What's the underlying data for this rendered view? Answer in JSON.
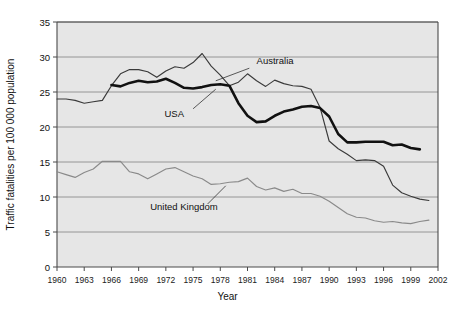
{
  "chart_data": {
    "type": "line",
    "title": "",
    "xlabel": "Year",
    "ylabel": "Traffic fatalities per 100 000 population",
    "xlim": [
      1960,
      2002
    ],
    "ylim": [
      0,
      35
    ],
    "yticks": [
      0,
      5,
      10,
      15,
      20,
      25,
      30,
      35
    ],
    "xticks": [
      1960,
      1963,
      1966,
      1969,
      1972,
      1975,
      1978,
      1981,
      1984,
      1987,
      1990,
      1993,
      1996,
      1999,
      2002
    ],
    "grid": true,
    "legend_position": "inline-annotations",
    "series": [
      {
        "name": "Australia",
        "color": "#3a3a3a",
        "x": [
          1960,
          1961,
          1962,
          1963,
          1964,
          1965,
          1966,
          1967,
          1968,
          1969,
          1970,
          1971,
          1972,
          1973,
          1974,
          1975,
          1976,
          1977,
          1978,
          1979,
          1980,
          1981,
          1982,
          1983,
          1984,
          1985,
          1986,
          1987,
          1988,
          1989,
          1990,
          1991,
          1992,
          1993,
          1994,
          1995,
          1996,
          1997,
          1998,
          1999,
          2000,
          2001
        ],
        "values": [
          24.0,
          24.0,
          23.8,
          23.4,
          23.6,
          23.8,
          25.9,
          27.6,
          28.2,
          28.2,
          27.9,
          27.1,
          28.0,
          28.6,
          28.4,
          29.2,
          30.5,
          28.7,
          27.4,
          25.9,
          26.4,
          27.6,
          26.6,
          25.8,
          26.7,
          26.2,
          25.9,
          25.8,
          25.4,
          22.8,
          18.0,
          16.9,
          16.1,
          15.2,
          15.3,
          15.2,
          14.4,
          11.7,
          10.6,
          10.1,
          9.7,
          9.5
        ]
      },
      {
        "name": "USA",
        "color": "#111111",
        "x": [
          1966,
          1967,
          1968,
          1969,
          1970,
          1971,
          1972,
          1973,
          1974,
          1975,
          1976,
          1977,
          1978,
          1979,
          1980,
          1981,
          1982,
          1983,
          1984,
          1985,
          1986,
          1987,
          1988,
          1989,
          1990,
          1991,
          1992,
          1993,
          1994,
          1995,
          1996,
          1997,
          1998,
          1999,
          2000
        ],
        "values": [
          26.0,
          25.8,
          26.3,
          26.6,
          26.4,
          26.5,
          26.9,
          26.3,
          25.6,
          25.5,
          25.7,
          26.0,
          26.1,
          25.9,
          23.4,
          21.6,
          20.7,
          20.8,
          21.6,
          22.2,
          22.5,
          22.9,
          23.0,
          22.7,
          21.5,
          19.0,
          17.8,
          17.8,
          17.9,
          17.9,
          17.9,
          17.4,
          17.5,
          17.0,
          16.8
        ]
      },
      {
        "name": "United Kingdom",
        "color": "#8a8a8a",
        "x": [
          1960,
          1961,
          1962,
          1963,
          1964,
          1965,
          1966,
          1967,
          1968,
          1969,
          1970,
          1971,
          1972,
          1973,
          1974,
          1975,
          1976,
          1977,
          1978,
          1979,
          1980,
          1981,
          1982,
          1983,
          1984,
          1985,
          1986,
          1987,
          1988,
          1989,
          1990,
          1991,
          1992,
          1993,
          1994,
          1995,
          1996,
          1997,
          1998,
          1999,
          2000,
          2001
        ],
        "values": [
          13.6,
          13.2,
          12.8,
          13.5,
          14.0,
          15.1,
          15.1,
          15.1,
          13.6,
          13.3,
          12.6,
          13.3,
          14.0,
          14.2,
          13.6,
          13.0,
          12.6,
          11.8,
          11.9,
          12.1,
          12.2,
          12.7,
          11.5,
          11.0,
          11.3,
          10.8,
          11.1,
          10.5,
          10.5,
          10.1,
          9.4,
          8.5,
          7.6,
          7.1,
          7.0,
          6.6,
          6.4,
          6.5,
          6.3,
          6.2,
          6.5,
          6.7
        ]
      }
    ],
    "annotations": [
      {
        "text": "Australia",
        "x": 1982,
        "y": 29.0
      },
      {
        "text": "USA",
        "x": 1974,
        "y": 21.5
      },
      {
        "text": "United Kingdom",
        "x": 1974,
        "y": 8.2
      }
    ]
  },
  "axes": {
    "ylabel": "Traffic fatalities per 100 000 population",
    "xlabel": "Year",
    "ytick_labels": [
      "35",
      "30",
      "25",
      "20",
      "15",
      "10",
      "5",
      "0"
    ],
    "xtick_labels": [
      "1960",
      "1963",
      "1966",
      "1969",
      "1972",
      "1975",
      "1978",
      "1981",
      "1984",
      "1987",
      "1990",
      "1993",
      "1996",
      "1999",
      "2002"
    ]
  },
  "colors": {
    "plot_background": "#e6e6e6",
    "gridline": "#8d8d8d",
    "axis": "#4a4a4a",
    "usa": "#111111",
    "australia": "#3a3a3a",
    "united_kingdom": "#8a8a8a"
  }
}
